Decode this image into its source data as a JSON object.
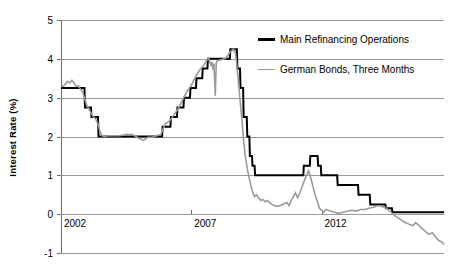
{
  "chart_data": {
    "type": "line",
    "title": "",
    "xlabel": "",
    "ylabel": "Interest Rate (%)",
    "ylim": [
      -1,
      5
    ],
    "xlim": [
      2002,
      2016.7
    ],
    "grid": true,
    "y_ticks": [
      "5",
      "4",
      "3",
      "2",
      "1",
      "0",
      "-1"
    ],
    "y_tick_values": [
      5,
      4,
      3,
      2,
      1,
      0,
      -1
    ],
    "x_ticks": [
      "2002",
      "2007",
      "2012"
    ],
    "x_tick_values": [
      2002,
      2007,
      2012
    ],
    "legend_position": "top-right",
    "series": [
      {
        "name": "Main Refinancing Operations",
        "color": "#000000",
        "width": 2.0,
        "style": "step",
        "points": [
          [
            2002.0,
            3.25
          ],
          [
            2002.9,
            3.25
          ],
          [
            2002.92,
            2.75
          ],
          [
            2003.15,
            2.75
          ],
          [
            2003.17,
            2.5
          ],
          [
            2003.42,
            2.5
          ],
          [
            2003.44,
            2.0
          ],
          [
            2005.88,
            2.0
          ],
          [
            2005.9,
            2.25
          ],
          [
            2006.2,
            2.25
          ],
          [
            2006.22,
            2.5
          ],
          [
            2006.45,
            2.5
          ],
          [
            2006.47,
            2.75
          ],
          [
            2006.7,
            2.75
          ],
          [
            2006.72,
            3.0
          ],
          [
            2006.95,
            3.0
          ],
          [
            2006.97,
            3.25
          ],
          [
            2007.18,
            3.25
          ],
          [
            2007.2,
            3.5
          ],
          [
            2007.42,
            3.5
          ],
          [
            2007.44,
            3.75
          ],
          [
            2007.62,
            3.75
          ],
          [
            2007.64,
            4.0
          ],
          [
            2008.48,
            4.0
          ],
          [
            2008.5,
            4.25
          ],
          [
            2008.75,
            4.25
          ],
          [
            2008.77,
            3.75
          ],
          [
            2008.87,
            3.75
          ],
          [
            2008.89,
            3.25
          ],
          [
            2008.99,
            3.25
          ],
          [
            2009.01,
            2.5
          ],
          [
            2009.13,
            2.5
          ],
          [
            2009.15,
            2.0
          ],
          [
            2009.23,
            2.0
          ],
          [
            2009.25,
            1.5
          ],
          [
            2009.33,
            1.5
          ],
          [
            2009.35,
            1.25
          ],
          [
            2009.43,
            1.25
          ],
          [
            2009.45,
            1.0
          ],
          [
            2011.3,
            1.0
          ],
          [
            2011.32,
            1.25
          ],
          [
            2011.55,
            1.25
          ],
          [
            2011.57,
            1.5
          ],
          [
            2011.85,
            1.5
          ],
          [
            2011.87,
            1.25
          ],
          [
            2011.97,
            1.25
          ],
          [
            2011.99,
            1.0
          ],
          [
            2012.6,
            1.0
          ],
          [
            2012.62,
            0.75
          ],
          [
            2013.4,
            0.75
          ],
          [
            2013.42,
            0.5
          ],
          [
            2013.85,
            0.5
          ],
          [
            2013.87,
            0.25
          ],
          [
            2014.45,
            0.25
          ],
          [
            2014.47,
            0.15
          ],
          [
            2014.7,
            0.15
          ],
          [
            2014.72,
            0.05
          ],
          [
            2016.7,
            0.05
          ]
        ]
      },
      {
        "name": "German Bonds, Three Months",
        "color": "#9a9a9a",
        "width": 1.6,
        "style": "noisy",
        "points": [
          [
            2002.0,
            3.28
          ],
          [
            2002.08,
            3.3
          ],
          [
            2002.17,
            3.35
          ],
          [
            2002.25,
            3.42
          ],
          [
            2002.33,
            3.38
          ],
          [
            2002.42,
            3.45
          ],
          [
            2002.5,
            3.38
          ],
          [
            2002.58,
            3.3
          ],
          [
            2002.67,
            3.3
          ],
          [
            2002.75,
            3.22
          ],
          [
            2002.83,
            3.15
          ],
          [
            2002.92,
            2.95
          ],
          [
            2003.0,
            2.78
          ],
          [
            2003.08,
            2.7
          ],
          [
            2003.17,
            2.58
          ],
          [
            2003.25,
            2.5
          ],
          [
            2003.33,
            2.45
          ],
          [
            2003.42,
            2.32
          ],
          [
            2003.5,
            2.12
          ],
          [
            2003.58,
            2.02
          ],
          [
            2003.67,
            2.0
          ],
          [
            2003.83,
            2.02
          ],
          [
            2004.0,
            2.02
          ],
          [
            2004.25,
            2.02
          ],
          [
            2004.5,
            2.05
          ],
          [
            2004.75,
            2.05
          ],
          [
            2005.0,
            1.95
          ],
          [
            2005.17,
            1.9
          ],
          [
            2005.33,
            1.98
          ],
          [
            2005.5,
            1.98
          ],
          [
            2005.67,
            2.02
          ],
          [
            2005.83,
            2.05
          ],
          [
            2005.92,
            2.2
          ],
          [
            2006.0,
            2.32
          ],
          [
            2006.17,
            2.4
          ],
          [
            2006.33,
            2.55
          ],
          [
            2006.5,
            2.72
          ],
          [
            2006.67,
            2.95
          ],
          [
            2006.83,
            3.15
          ],
          [
            2007.0,
            3.32
          ],
          [
            2007.17,
            3.55
          ],
          [
            2007.33,
            3.72
          ],
          [
            2007.5,
            3.85
          ],
          [
            2007.58,
            3.95
          ],
          [
            2007.67,
            4.02
          ],
          [
            2007.75,
            3.85
          ],
          [
            2007.79,
            3.92
          ],
          [
            2007.83,
            3.72
          ],
          [
            2007.87,
            3.88
          ],
          [
            2007.92,
            3.05
          ],
          [
            2007.96,
            3.9
          ],
          [
            2008.0,
            3.95
          ],
          [
            2008.17,
            3.98
          ],
          [
            2008.33,
            4.02
          ],
          [
            2008.5,
            4.18
          ],
          [
            2008.62,
            4.25
          ],
          [
            2008.7,
            4.15
          ],
          [
            2008.79,
            3.55
          ],
          [
            2008.87,
            2.95
          ],
          [
            2008.95,
            2.4
          ],
          [
            2009.0,
            1.95
          ],
          [
            2009.08,
            1.45
          ],
          [
            2009.17,
            1.1
          ],
          [
            2009.25,
            0.85
          ],
          [
            2009.33,
            0.62
          ],
          [
            2009.42,
            0.45
          ],
          [
            2009.5,
            0.5
          ],
          [
            2009.58,
            0.42
          ],
          [
            2009.67,
            0.35
          ],
          [
            2009.75,
            0.38
          ],
          [
            2009.83,
            0.32
          ],
          [
            2009.92,
            0.35
          ],
          [
            2010.0,
            0.3
          ],
          [
            2010.17,
            0.22
          ],
          [
            2010.33,
            0.2
          ],
          [
            2010.5,
            0.25
          ],
          [
            2010.67,
            0.3
          ],
          [
            2010.75,
            0.22
          ],
          [
            2010.83,
            0.35
          ],
          [
            2010.92,
            0.45
          ],
          [
            2011.0,
            0.55
          ],
          [
            2011.08,
            0.42
          ],
          [
            2011.17,
            0.55
          ],
          [
            2011.25,
            0.7
          ],
          [
            2011.33,
            0.85
          ],
          [
            2011.42,
            1.0
          ],
          [
            2011.5,
            1.12
          ],
          [
            2011.58,
            0.95
          ],
          [
            2011.67,
            0.72
          ],
          [
            2011.75,
            0.5
          ],
          [
            2011.83,
            0.35
          ],
          [
            2011.92,
            0.15
          ],
          [
            2012.0,
            0.1
          ],
          [
            2012.08,
            0.05
          ],
          [
            2012.17,
            0.12
          ],
          [
            2012.25,
            0.1
          ],
          [
            2012.33,
            0.08
          ],
          [
            2012.5,
            0.05
          ],
          [
            2012.67,
            0.02
          ],
          [
            2012.83,
            0.05
          ],
          [
            2013.0,
            0.08
          ],
          [
            2013.17,
            0.1
          ],
          [
            2013.33,
            0.08
          ],
          [
            2013.5,
            0.12
          ],
          [
            2013.67,
            0.12
          ],
          [
            2013.83,
            0.15
          ],
          [
            2014.0,
            0.18
          ],
          [
            2014.17,
            0.22
          ],
          [
            2014.33,
            0.2
          ],
          [
            2014.5,
            0.15
          ],
          [
            2014.67,
            0.05
          ],
          [
            2014.83,
            -0.05
          ],
          [
            2015.0,
            -0.12
          ],
          [
            2015.17,
            -0.2
          ],
          [
            2015.33,
            -0.25
          ],
          [
            2015.5,
            -0.3
          ],
          [
            2015.62,
            -0.22
          ],
          [
            2015.75,
            -0.3
          ],
          [
            2015.87,
            -0.38
          ],
          [
            2016.0,
            -0.45
          ],
          [
            2016.12,
            -0.52
          ],
          [
            2016.25,
            -0.48
          ],
          [
            2016.37,
            -0.58
          ],
          [
            2016.5,
            -0.68
          ],
          [
            2016.62,
            -0.72
          ],
          [
            2016.7,
            -0.78
          ]
        ]
      }
    ]
  },
  "legend": {
    "items": [
      {
        "label": "Main Refinancing Operations",
        "color": "#000000",
        "thickness": "2.5px"
      },
      {
        "label": "German Bonds, Three Months",
        "color": "#9a9a9a",
        "thickness": "1.5px"
      }
    ]
  },
  "colors": {
    "grid": "#9a9a9a",
    "axis": "#6e6e6e",
    "background": "#ffffff",
    "series_black": "#000000",
    "series_gray": "#9a9a9a"
  }
}
